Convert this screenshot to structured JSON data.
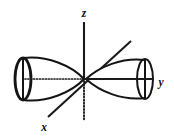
{
  "figure": {
    "background_color": "#ffffff",
    "stroke_color": "#141414",
    "width": 174,
    "height": 140
  },
  "axes": [
    {
      "id": "z",
      "label": "z",
      "label_x": 84,
      "label_y": 17,
      "direction": "vertical-up",
      "visible_segment": {
        "x1": 84,
        "y1": 22,
        "x2": 84,
        "y2": 78
      },
      "hidden_segment": {
        "x1": 84,
        "y1": 80,
        "x2": 84,
        "y2": 120
      },
      "style": "solid-above-origin-dotted-below"
    },
    {
      "id": "x",
      "label": "x",
      "label_x": 44,
      "label_y": 131,
      "direction": "diagonal-toward-viewer",
      "visible_segment": {
        "x1": 48,
        "y1": 117,
        "x2": 131,
        "y2": 41
      },
      "style": "solid"
    },
    {
      "id": "y",
      "label": "y",
      "label_x": 161,
      "label_y": 86,
      "direction": "horizontal-right",
      "visible_segment": {
        "x1": 84,
        "y1": 79,
        "x2": 153,
        "y2": 79
      },
      "hidden_segment": {
        "x1": 25,
        "y1": 79,
        "x2": 84,
        "y2": 79
      },
      "style": "solid-right-dotted-left"
    }
  ],
  "lobes": [
    {
      "id": "lobe-negative-y",
      "side": "left",
      "description": "rear cone lobe pointing at origin from negative y",
      "tip_x": 84,
      "tip_y": 79,
      "base_center_x": 23,
      "base_center_y": 79,
      "base_rx": 8,
      "base_ry": 21,
      "cap_emphasis": "thick"
    },
    {
      "id": "lobe-positive-y",
      "side": "right",
      "description": "front cone lobe pointing at origin from positive y",
      "tip_x": 86,
      "tip_y": 79,
      "base_center_x": 145,
      "base_center_y": 79,
      "base_rx": 8,
      "base_ry": 20,
      "cap_emphasis": "normal"
    }
  ],
  "origin": {
    "x": 84,
    "y": 79,
    "label": ""
  }
}
